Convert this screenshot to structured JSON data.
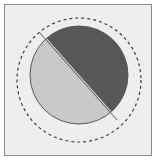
{
  "figure": {
    "kind": "geometric-diagram",
    "width": 159,
    "height": 164,
    "background_color": "#ffffff",
    "panel": {
      "fill_color": "#eeeeec",
      "border_color": "#8c8c8c",
      "x": 4,
      "y": 4,
      "width": 148,
      "height": 152
    },
    "dashed_circle": {
      "name": "dashed-outline-circle",
      "center_x": 79,
      "center_y": 80,
      "radius": 62,
      "stroke_color": "#3f3f3f",
      "stroke_width": 1.2,
      "dash_pattern": "3 3",
      "fill": "none"
    },
    "solid_circle": {
      "name": "split-disc",
      "center_x": 79,
      "center_y": 75,
      "radius": 49,
      "stroke_color": "#5a5a5a",
      "stroke_width": 1
    },
    "halves": [
      {
        "name": "dark-half-upper-right",
        "fill_color": "#58585a",
        "position": "upper-right"
      },
      {
        "name": "light-half-lower-left",
        "fill_color": "#c8c8c6",
        "position": "lower-left"
      }
    ],
    "divider": {
      "name": "diagonal-divider",
      "x1": 40,
      "y1": 33,
      "x2": 117,
      "y2": 120,
      "stroke_color": "#5a5a5a",
      "stroke_width": 1
    }
  }
}
